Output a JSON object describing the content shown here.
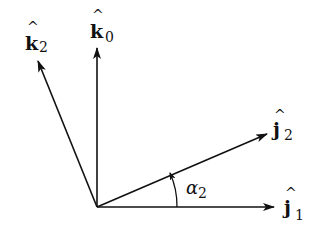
{
  "diagram": {
    "title": "",
    "vectors": [
      {
        "id": "k0",
        "base": "k",
        "subscript": "0",
        "hat": "^",
        "direction": "vertical-up"
      },
      {
        "id": "k2",
        "base": "k",
        "subscript": "2",
        "hat": "^",
        "direction": "up-left"
      },
      {
        "id": "j2",
        "base": "j",
        "subscript": "2",
        "hat": "^",
        "direction": "up-right"
      },
      {
        "id": "j1",
        "base": "j",
        "subscript": "1",
        "hat": "^",
        "direction": "horizontal-right"
      }
    ],
    "angle": {
      "symbol": "α",
      "subscript": "2",
      "between": [
        "j1",
        "j2"
      ]
    },
    "colors": {
      "stroke": "#111111",
      "background": "#ffffff"
    }
  }
}
